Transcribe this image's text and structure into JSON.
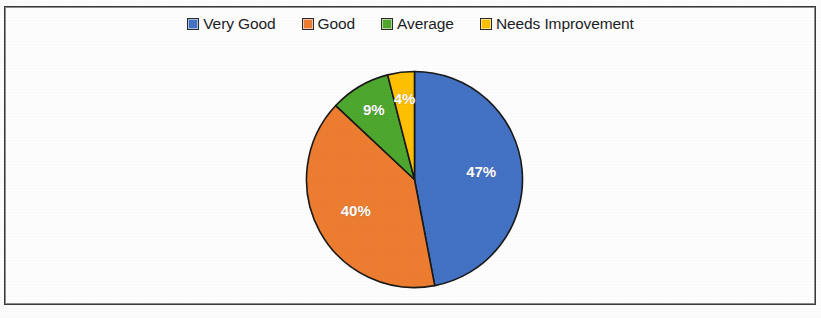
{
  "figure": {
    "background_color": "#fefefe",
    "frame_color": "#3a3a3c"
  },
  "legend": {
    "position": "top-center",
    "items": [
      {
        "label": "Very Good",
        "color": "#4472C4",
        "swatch_name": "legend-swatch-very-good"
      },
      {
        "label": "Good",
        "color": "#ED7D31",
        "swatch_name": "legend-swatch-good"
      },
      {
        "label": "Average",
        "color": "#4EA72E",
        "swatch_name": "legend-swatch-average"
      },
      {
        "label": "Needs Improvement",
        "color": "#FFC000",
        "swatch_name": "legend-swatch-needs-improvement"
      }
    ]
  },
  "chart_data": {
    "type": "pie",
    "title": "",
    "xlabel": "",
    "ylabel": "",
    "grid": false,
    "legend_position": "top-center",
    "start_angle_deg": 0,
    "direction": "clockwise",
    "categories": [
      "Very Good",
      "Good",
      "Average",
      "Needs Improvement"
    ],
    "values": [
      47,
      40,
      9,
      4
    ],
    "value_labels": [
      "47%",
      "40%",
      "9%",
      "4%"
    ],
    "colors": [
      "#4472C4",
      "#ED7D31",
      "#4EA72E",
      "#FFC000"
    ],
    "slices": [
      {
        "name": "Very Good",
        "value": 47,
        "label": "47%",
        "color": "#4472C4",
        "label_x": 158,
        "label_y": 113
      },
      {
        "name": "Good",
        "value": 40,
        "label": "40%",
        "color": "#ED7D31",
        "label_y": 150,
        "label_x": 57
      },
      {
        "name": "Average",
        "value": 9,
        "label": "9%",
        "color": "#4EA72E",
        "label_x": 76,
        "label_y": 44
      },
      {
        "name": "Needs Improvement",
        "value": 4,
        "label": "4%",
        "color": "#FFC000",
        "label_x": 105,
        "label_y": 30
      }
    ]
  }
}
